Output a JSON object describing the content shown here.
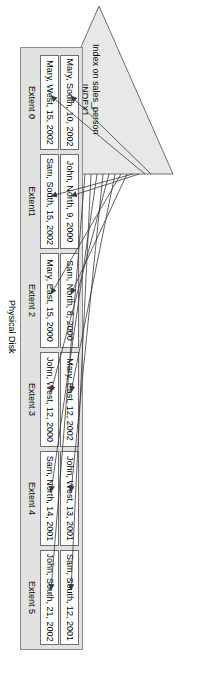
{
  "diagram": {
    "title_index": {
      "line1": "Index on sales_person",
      "line2": "INDEX1"
    },
    "disk_caption": "Physical Disk",
    "extents": [
      {
        "label": "Extent 0",
        "rows": [
          "Mary, South, 10, 2002",
          "Mary, West, 15, 2002"
        ]
      },
      {
        "label": "Extent1",
        "rows": [
          "John, North, 9, 2000",
          "Sam, South, 15, 2002"
        ]
      },
      {
        "label": "Extent 2",
        "rows": [
          "Sam, North, 8, 2000",
          "Mary, East, 15, 2000"
        ]
      },
      {
        "label": "Extent 3",
        "rows": [
          "Mary, East, 12, 2002",
          "John, West, 12, 2000"
        ]
      },
      {
        "label": "Extent 4",
        "rows": [
          "John, West, 13, 2001",
          "Sam, North, 14, 2001"
        ]
      },
      {
        "label": "Extent 5",
        "rows": [
          "Sam, South, 12, 2001",
          "John, South, 21, 2002"
        ]
      }
    ],
    "colors": {
      "triangle_fill": "#e8e8e8",
      "triangle_stroke": "#6e6e6e",
      "disk_fill": "#e2e2e2",
      "disk_stroke": "#8c8c8c",
      "cell_fill": "#ffffff",
      "cell_stroke": "#6e6e6e",
      "arrow": "#3a3a3a",
      "text": "#000000"
    }
  }
}
